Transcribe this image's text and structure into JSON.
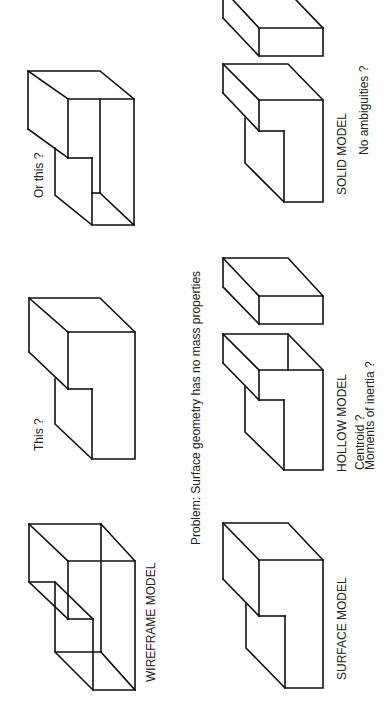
{
  "labels": {
    "wireframe": "WIREFRAME MODEL",
    "surface": "SURFACE MODEL",
    "hollow": "HOLLOW MODEL",
    "hollow_q1": "Centroid ?",
    "hollow_q2": "Moments of inertia ?",
    "solid": "SOLID MODEL",
    "solid_q": "No ambiguities ?",
    "this": "This ?",
    "or_this": "Or this ?",
    "problem": "Problem: Surface geometry has no mass properties"
  },
  "colors": {
    "line": "#111111",
    "text": "#222222",
    "background": "#ffffff"
  },
  "orientation": "page rotated 90° counter-clockwise"
}
